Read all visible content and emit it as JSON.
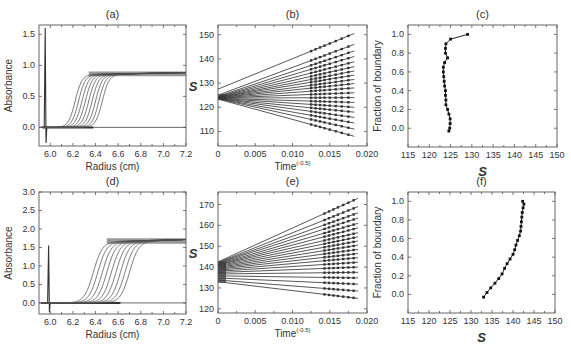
{
  "figure": {
    "panels": [
      "(a)",
      "(b)",
      "(c)",
      "(d)",
      "(e)",
      "(f)"
    ]
  },
  "chart_data": [
    {
      "id": "a",
      "type": "line",
      "title": "(a)",
      "xlabel": "Radius (cm)",
      "ylabel": "Absorbance",
      "xlim": [
        5.9,
        7.2
      ],
      "ylim": [
        -0.3,
        1.65
      ],
      "xticks": [
        6.0,
        6.2,
        6.4,
        6.6,
        6.8,
        7.0,
        7.2
      ],
      "xtick_labels": [
        "6.0",
        "6.2",
        "6.4",
        "6.6",
        "6.8",
        "7.0",
        "7.2"
      ],
      "yticks": [
        0.0,
        0.5,
        1.0,
        1.5
      ],
      "ytick_labels": [
        "0.0",
        "0.5",
        "1.0",
        "1.5"
      ],
      "meniscus_spike": {
        "x": 5.955,
        "ymax": 1.6,
        "ymin": -0.25
      },
      "baseline": 0.0,
      "plateau": 0.85,
      "series_midpoints": [
        6.22,
        6.25,
        6.28,
        6.31,
        6.34,
        6.37,
        6.4,
        6.43,
        6.46
      ],
      "boundary_width": 0.03,
      "grid": false
    },
    {
      "id": "b",
      "type": "line",
      "title": "(b)",
      "xlabel": "Time",
      "xlabel_sup": "(-0.5)",
      "ylabel": "S",
      "xlim": [
        0,
        0.02
      ],
      "ylim": [
        104,
        154
      ],
      "xticks": [
        0,
        0.005,
        0.01,
        0.015,
        0.02
      ],
      "xtick_labels": [
        "0",
        "0.005",
        "0.010",
        "0.015",
        "0.020"
      ],
      "yticks": [
        110,
        120,
        130,
        140,
        150
      ],
      "ytick_labels": [
        "110",
        "120",
        "130",
        "140",
        "150"
      ],
      "data_x": [
        0.0125,
        0.0131,
        0.0137,
        0.0143,
        0.015,
        0.0158,
        0.0166,
        0.0175
      ],
      "fit_x_end": 0.0183,
      "lines": [
        {
          "intercept": 127.5,
          "end": 150.5
        },
        {
          "intercept": 125.0,
          "end": 146.0
        },
        {
          "intercept": 124.5,
          "end": 143.3
        },
        {
          "intercept": 124.3,
          "end": 141.0
        },
        {
          "intercept": 124.2,
          "end": 138.8
        },
        {
          "intercept": 124.1,
          "end": 136.8
        },
        {
          "intercept": 124.0,
          "end": 135.0
        },
        {
          "intercept": 124.0,
          "end": 133.3
        },
        {
          "intercept": 123.9,
          "end": 131.5
        },
        {
          "intercept": 123.9,
          "end": 129.8
        },
        {
          "intercept": 123.8,
          "end": 128.0
        },
        {
          "intercept": 123.8,
          "end": 126.0
        },
        {
          "intercept": 123.8,
          "end": 124.0
        },
        {
          "intercept": 123.7,
          "end": 122.0
        },
        {
          "intercept": 123.7,
          "end": 120.0
        },
        {
          "intercept": 123.6,
          "end": 118.0
        },
        {
          "intercept": 123.6,
          "end": 115.8
        },
        {
          "intercept": 123.5,
          "end": 113.5
        },
        {
          "intercept": 123.5,
          "end": 111.0
        },
        {
          "intercept": 123.4,
          "end": 108.0
        }
      ],
      "grid": false
    },
    {
      "id": "c",
      "type": "line",
      "title": "(c)",
      "xlabel": "S",
      "ylabel": "Fraction of boundary",
      "xlim": [
        115,
        150
      ],
      "ylim": [
        -0.2,
        1.1
      ],
      "xticks": [
        115,
        120,
        125,
        130,
        135,
        140,
        145,
        150
      ],
      "xtick_labels": [
        "115",
        "120",
        "125",
        "130",
        "135",
        "140",
        "145",
        "150"
      ],
      "yticks": [
        0.0,
        0.2,
        0.4,
        0.6,
        0.8,
        1.0
      ],
      "ytick_labels": [
        "0.0",
        "0.2",
        "0.4",
        "0.6",
        "0.8",
        "1.0"
      ],
      "points": [
        [
          124.6,
          -0.03
        ],
        [
          124.8,
          0.0
        ],
        [
          124.9,
          0.05
        ],
        [
          124.9,
          0.1
        ],
        [
          124.6,
          0.15
        ],
        [
          124.3,
          0.2
        ],
        [
          123.9,
          0.25
        ],
        [
          123.9,
          0.3
        ],
        [
          123.8,
          0.35
        ],
        [
          123.8,
          0.4
        ],
        [
          123.6,
          0.45
        ],
        [
          123.5,
          0.5
        ],
        [
          123.4,
          0.55
        ],
        [
          123.3,
          0.6
        ],
        [
          123.3,
          0.65
        ],
        [
          123.6,
          0.7
        ],
        [
          124.3,
          0.75
        ],
        [
          123.8,
          0.8
        ],
        [
          123.8,
          0.85
        ],
        [
          123.9,
          0.9
        ],
        [
          125.0,
          0.95
        ],
        [
          129.0,
          1.0
        ]
      ],
      "grid": false
    },
    {
      "id": "d",
      "type": "line",
      "title": "(d)",
      "xlabel": "Radius (cm)",
      "ylabel": "Absorbance",
      "xlim": [
        5.9,
        7.2
      ],
      "ylim": [
        -0.3,
        3.0
      ],
      "xticks": [
        6.0,
        6.2,
        6.4,
        6.6,
        6.8,
        7.0,
        7.2
      ],
      "xtick_labels": [
        "6.0",
        "6.2",
        "6.4",
        "6.6",
        "6.8",
        "7.0",
        "7.2"
      ],
      "yticks": [
        0.0,
        0.5,
        1.0,
        1.5,
        2.0,
        2.5,
        3.0
      ],
      "ytick_labels": [
        "0.0",
        "0.5",
        "1.0",
        "1.5",
        "2.0",
        "2.5",
        "3.0"
      ],
      "meniscus_spike": {
        "x": 5.985,
        "ymax": 1.55,
        "ymin": -0.25
      },
      "baseline": 0.0,
      "plateau": 1.65,
      "series_midpoints": [
        6.38,
        6.42,
        6.46,
        6.5,
        6.54,
        6.58,
        6.62,
        6.66,
        6.7
      ],
      "boundary_width": 0.04,
      "grid": false
    },
    {
      "id": "e",
      "type": "line",
      "title": "(e)",
      "xlabel": "Time",
      "xlabel_sup": "(-0.5)",
      "ylabel": "S",
      "xlim": [
        0,
        0.02
      ],
      "ylim": [
        118,
        176
      ],
      "xticks": [
        0,
        0.005,
        0.01,
        0.015,
        0.02
      ],
      "xtick_labels": [
        "0",
        "0.005",
        "0.010",
        "0.015",
        "0.020"
      ],
      "yticks": [
        120,
        130,
        140,
        150,
        160,
        170
      ],
      "ytick_labels": [
        "120",
        "130",
        "140",
        "150",
        "160",
        "170"
      ],
      "data_x": [
        0.0143,
        0.0149,
        0.0155,
        0.0161,
        0.0168,
        0.0175,
        0.0182
      ],
      "fit_x_end": 0.0188,
      "lines": [
        {
          "intercept": 142.5,
          "end": 173.0
        },
        {
          "intercept": 142.2,
          "end": 169.0
        },
        {
          "intercept": 142.0,
          "end": 166.0
        },
        {
          "intercept": 141.8,
          "end": 163.5
        },
        {
          "intercept": 141.5,
          "end": 161.0
        },
        {
          "intercept": 141.2,
          "end": 158.8
        },
        {
          "intercept": 141.0,
          "end": 156.5
        },
        {
          "intercept": 140.6,
          "end": 154.5
        },
        {
          "intercept": 140.2,
          "end": 152.5
        },
        {
          "intercept": 139.8,
          "end": 150.5
        },
        {
          "intercept": 139.4,
          "end": 148.5
        },
        {
          "intercept": 139.0,
          "end": 146.5
        },
        {
          "intercept": 138.5,
          "end": 144.5
        },
        {
          "intercept": 138.0,
          "end": 142.3
        },
        {
          "intercept": 137.4,
          "end": 140.0
        },
        {
          "intercept": 136.7,
          "end": 137.5
        },
        {
          "intercept": 135.8,
          "end": 134.8
        },
        {
          "intercept": 134.8,
          "end": 131.8
        },
        {
          "intercept": 133.8,
          "end": 128.5
        },
        {
          "intercept": 133.0,
          "end": 125.0
        }
      ],
      "grid": false
    },
    {
      "id": "f",
      "type": "line",
      "title": "(f)",
      "xlabel": "S",
      "ylabel": "Fraction of boundary",
      "xlim": [
        115,
        150
      ],
      "ylim": [
        -0.2,
        1.1
      ],
      "xticks": [
        115,
        120,
        125,
        130,
        135,
        140,
        145,
        150
      ],
      "xtick_labels": [
        "115",
        "120",
        "125",
        "130",
        "135",
        "140",
        "145",
        "150"
      ],
      "yticks": [
        0.0,
        0.2,
        0.4,
        0.6,
        0.8,
        1.0
      ],
      "ytick_labels": [
        "0.0",
        "0.2",
        "0.4",
        "0.6",
        "0.8",
        "1.0"
      ],
      "points": [
        [
          133.0,
          -0.03
        ],
        [
          133.8,
          0.02
        ],
        [
          134.7,
          0.07
        ],
        [
          135.7,
          0.12
        ],
        [
          136.6,
          0.17
        ],
        [
          137.4,
          0.22
        ],
        [
          138.0,
          0.28
        ],
        [
          138.6,
          0.33
        ],
        [
          139.3,
          0.38
        ],
        [
          140.0,
          0.43
        ],
        [
          140.4,
          0.48
        ],
        [
          140.7,
          0.53
        ],
        [
          141.1,
          0.58
        ],
        [
          141.5,
          0.63
        ],
        [
          141.8,
          0.68
        ],
        [
          141.9,
          0.73
        ],
        [
          142.0,
          0.78
        ],
        [
          142.1,
          0.83
        ],
        [
          142.2,
          0.88
        ],
        [
          142.4,
          0.93
        ],
        [
          142.6,
          0.97
        ],
        [
          142.3,
          1.0
        ]
      ],
      "grid": false
    }
  ]
}
